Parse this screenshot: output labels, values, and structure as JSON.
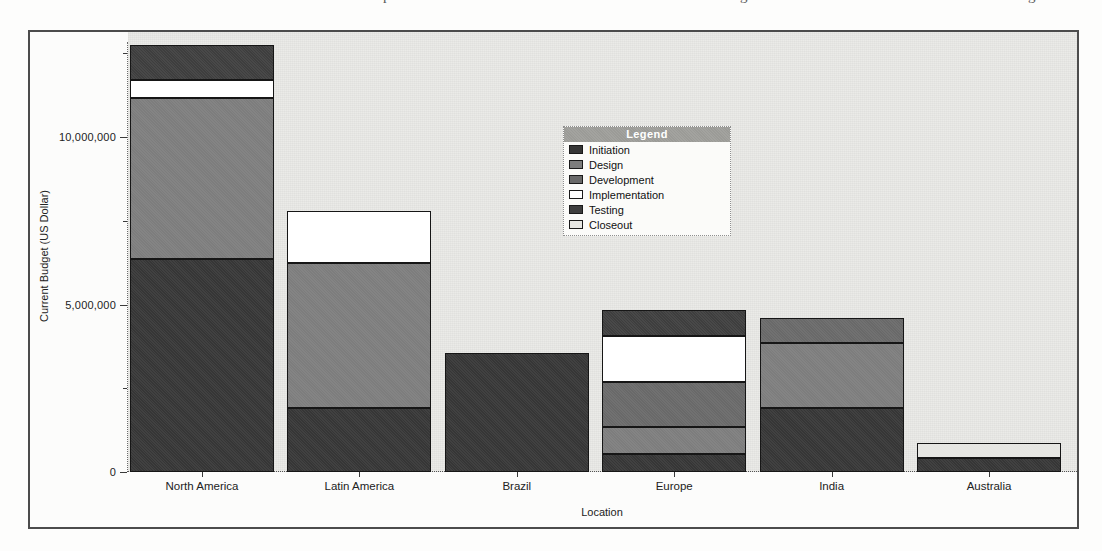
{
  "chart_data": {
    "type": "bar",
    "stacked": true,
    "title": "",
    "xlabel": "Location",
    "ylabel": "Current Budget (US Dollar)",
    "ylim": [
      0,
      13000000
    ],
    "grid": false,
    "legend_position": "inside-top-center",
    "legend_title": "Legend",
    "categories": [
      "North America",
      "Latin America",
      "Brazil",
      "Europe",
      "India",
      "Australia"
    ],
    "series": [
      {
        "name": "Initiation",
        "color": "#363636",
        "values": [
          6350000,
          1900000,
          3550000,
          550000,
          1900000,
          420000
        ]
      },
      {
        "name": "Design",
        "color": "#7d7d7d",
        "values": [
          4800000,
          4350000,
          0,
          800000,
          1950000,
          0
        ]
      },
      {
        "name": "Development",
        "color": "#696969",
        "values": [
          0,
          0,
          0,
          1350000,
          750000,
          0
        ]
      },
      {
        "name": "Implementation",
        "color": "#ffffff",
        "values": [
          550000,
          1550000,
          0,
          1350000,
          0,
          0
        ]
      },
      {
        "name": "Testing",
        "color": "#3e3e3e",
        "values": [
          1050000,
          0,
          0,
          800000,
          0,
          0
        ]
      },
      {
        "name": "Closeout",
        "color": "#e6e6e2",
        "values": [
          0,
          0,
          0,
          0,
          0,
          460000
        ]
      }
    ],
    "yticks": [
      {
        "value": 0,
        "label": "0"
      },
      {
        "value": 5000000,
        "label": "5,000,000"
      },
      {
        "value": 10000000,
        "label": "10,000,000"
      }
    ],
    "minor_yticks": [
      2500000,
      7500000,
      12500000
    ],
    "totals": [
      12750000,
      7800000,
      3550000,
      4850000,
      4600000,
      880000
    ]
  },
  "artifacts": {
    "caption_fragments": [
      "p",
      "g",
      "g"
    ]
  }
}
